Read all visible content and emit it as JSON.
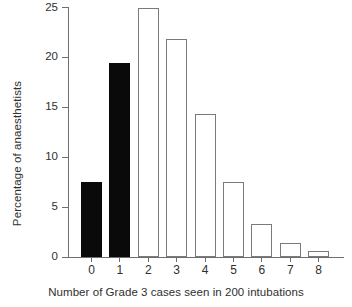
{
  "chart_data": {
    "type": "bar",
    "title": "",
    "xlabel": "Number of Grade 3 cases seen in 200 intubations",
    "ylabel": "Percentage of anaesthetists",
    "categories": [
      "0",
      "1",
      "2",
      "3",
      "4",
      "5",
      "6",
      "7",
      "8"
    ],
    "values": [
      7.5,
      19.4,
      25.0,
      21.8,
      14.3,
      7.5,
      3.3,
      1.4,
      0.6
    ],
    "bar_styles": [
      "filled",
      "filled",
      "hollow",
      "hollow",
      "hollow",
      "hollow",
      "hollow",
      "hollow",
      "hollow"
    ],
    "colors": {
      "filled": "#0a0a0a",
      "hollow_fill": "#ffffff",
      "hollow_edge": "#7a7a7a",
      "axis": "#6e6e6e",
      "text": "#2f2f2f",
      "background": "#ffffff"
    },
    "ylim": [
      0,
      25
    ],
    "yticks": [
      0,
      5,
      10,
      15,
      20,
      25
    ],
    "ytick_labels": [
      "0",
      "5",
      "10",
      "15",
      "20",
      "25"
    ],
    "xtick_labels": [
      "0",
      "1",
      "2",
      "3",
      "4",
      "5",
      "6",
      "7",
      "8"
    ],
    "grid": false,
    "legend": null
  }
}
